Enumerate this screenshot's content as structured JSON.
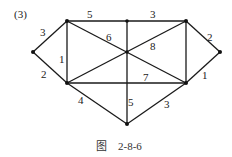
{
  "figure": {
    "tag": "(3)",
    "caption_prefix": "图",
    "caption_number": "2-8-6"
  },
  "graph": {
    "vertices": [
      "A",
      "B",
      "C",
      "D",
      "E",
      "F",
      "G",
      "H",
      "I"
    ],
    "edges": [
      {
        "from": "A",
        "to": "B",
        "weight": "3"
      },
      {
        "from": "A",
        "to": "F",
        "weight": "2"
      },
      {
        "from": "B",
        "to": "F",
        "weight": "1"
      },
      {
        "from": "B",
        "to": "C",
        "weight": "5"
      },
      {
        "from": "C",
        "to": "D",
        "weight": "3"
      },
      {
        "from": "D",
        "to": "E",
        "weight": "2"
      },
      {
        "from": "E",
        "to": "H",
        "weight": "1"
      },
      {
        "from": "D",
        "to": "H",
        "weight": ""
      },
      {
        "from": "B",
        "to": "H",
        "weight": "6"
      },
      {
        "from": "F",
        "to": "D",
        "weight": "8"
      },
      {
        "from": "C",
        "to": "I",
        "weight": "5"
      },
      {
        "from": "F",
        "to": "H",
        "weight": "7"
      },
      {
        "from": "F",
        "to": "I",
        "weight": "4"
      },
      {
        "from": "H",
        "to": "I",
        "weight": "3"
      }
    ]
  }
}
